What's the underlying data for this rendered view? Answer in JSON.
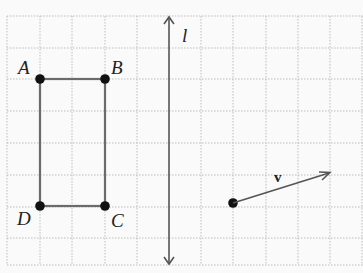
{
  "figure": {
    "type": "grid-diagram",
    "background": "#fafafa",
    "grid_color": "#bdbdbd",
    "shape_color": "#6b6b6b",
    "point_color": "#111111",
    "points": {
      "A": "A",
      "B": "B",
      "C": "C",
      "D": "D"
    },
    "line_label": "l",
    "vector_label": "v"
  }
}
